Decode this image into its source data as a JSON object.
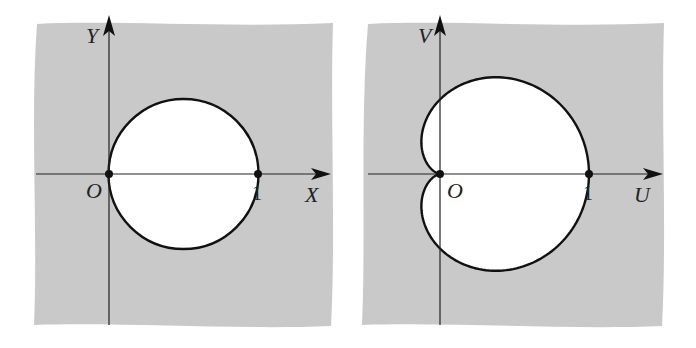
{
  "figure": {
    "colors": {
      "background": "#c9c9c9",
      "region": "#ffffff",
      "curve": "#111111"
    },
    "left_panel": {
      "vertical_axis_label": "Y",
      "horizontal_axis_label": "X",
      "origin_label": "O",
      "point_label": "1",
      "curve": "circle"
    },
    "right_panel": {
      "vertical_axis_label": "V",
      "horizontal_axis_label": "U",
      "origin_label": "O",
      "point_label": "1",
      "curve": "cardioid"
    }
  }
}
